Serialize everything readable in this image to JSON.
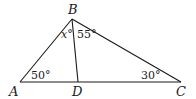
{
  "diagram": {
    "type": "geometry-triangle",
    "vertices": {
      "A": {
        "label": "A"
      },
      "B": {
        "label": "B"
      },
      "C": {
        "label": "C"
      },
      "D": {
        "label": "D"
      }
    },
    "angles": {
      "A": "50°",
      "C": "30°",
      "ABD": "x°",
      "DBC": "55°"
    },
    "segments": [
      "AB",
      "BC",
      "AC",
      "BD"
    ],
    "colors": {
      "stroke": "#1a1a1a",
      "background": "#ffffff"
    }
  }
}
